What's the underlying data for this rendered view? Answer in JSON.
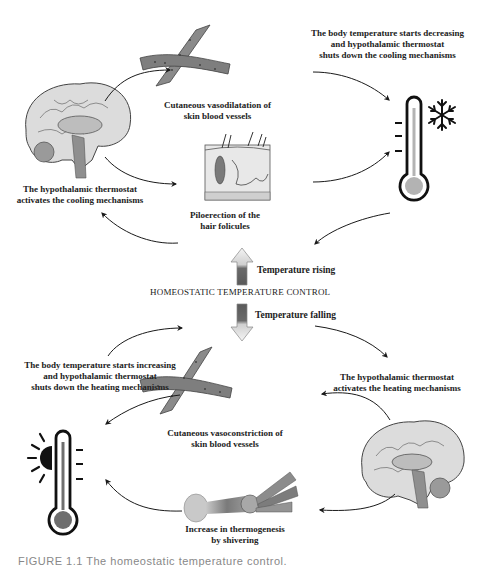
{
  "diagram": {
    "title": "HOMEOSTATIC TEMPERATURE CONTROL",
    "center": {
      "rising_label": "Temperature rising",
      "falling_label": "Temperature falling"
    },
    "cooling_cycle": {
      "brain_label": "The hypothalamic thermostat\nactivates the cooling mechanisms",
      "vasodilatation_label": "Cutaneous vasodilatation of\nskin blood vessels",
      "piloerection_label": "Piloerection of the\nhair folicules",
      "feedback_label": "The body temperature starts decreasing\nand hypothalamic thermostat\nshuts down the cooling mechanisms",
      "thermometer_icon": "thermometer-cold-snowflake-icon"
    },
    "heating_cycle": {
      "brain_label": "The hypothalamic thermostat\nactivates the heating mechanisms",
      "vasoconstriction_label": "Cutaneous vasoconstriction of\nskin blood vessels",
      "shivering_label": "Increase in thermogenesis\nby shivering",
      "feedback_label": "The body temperature starts increasing\nand hypothalamic thermostat\nshuts down the heating mechanisms",
      "thermometer_icon": "thermometer-hot-sun-icon"
    },
    "caption": "FIGURE 1.1   The homeostatic temperature control."
  },
  "colors": {
    "line": "#1a1a1a",
    "vessel": "#8a8a8a",
    "vessel_dark": "#5e5e5e",
    "brain": "#d9d9d9",
    "cold_bulb": "#b3b3b3",
    "hot_bulb": "#6e6e6e",
    "arrow_up_top": "#f2f2f2",
    "arrow_body": "#6a6a6a"
  }
}
